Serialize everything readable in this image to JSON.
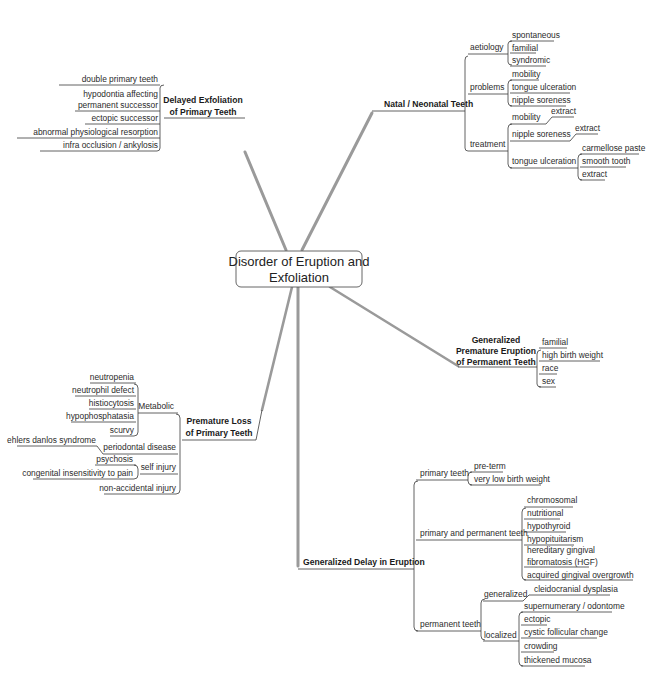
{
  "center": {
    "line1": "Disorder of Eruption and",
    "line2": "Exfoliation"
  },
  "delayed_exfoliation": {
    "title1": "Delayed Exfoliation",
    "title2": "of Primary Teeth",
    "items": [
      "double primary teeth",
      "hypodontia affecting",
      "permanent successor",
      "ectopic successor",
      "abnormal physiological resorption",
      "infra occlusion / ankylosis"
    ]
  },
  "natal": {
    "title": "Natal / Neonatal Teeth",
    "aetiology": {
      "label": "aetiology",
      "items": [
        "spontaneous",
        "familial",
        "syndromic"
      ]
    },
    "problems": {
      "label": "problems",
      "items": [
        "mobility",
        "tongue ulceration",
        "nipple soreness"
      ]
    },
    "treatment": {
      "label": "treatment",
      "mobility": {
        "label": "mobility",
        "items": [
          "extract"
        ]
      },
      "nipple": {
        "label": "nipple soreness",
        "items": [
          "extract"
        ]
      },
      "tongue": {
        "label": "tongue ulceration",
        "items": [
          "carmellose paste",
          "smooth tooth",
          "extract"
        ]
      }
    }
  },
  "premature_eruption": {
    "title1": "Generalized",
    "title2": "Premature Eruption",
    "title3": "of Permanent Teeth",
    "items": [
      "familial",
      "high birth weight",
      "race",
      "sex"
    ]
  },
  "premature_loss": {
    "title1": "Premature Loss",
    "title2": "of Primary Teeth",
    "metabolic": {
      "label": "Metabolic",
      "items": [
        "neutropenia",
        "neutrophil defect",
        "histiocytosis",
        "hypophosphatasia",
        "scurvy"
      ]
    },
    "periodontal": {
      "label": "periodontal disease",
      "items": [
        "ehlers danlos syndrome"
      ]
    },
    "self_injury": {
      "label": "self injury",
      "items": [
        "psychosis",
        "congenital insensitivity to pain"
      ]
    },
    "non_accidental": "non-accidental injury"
  },
  "delay_eruption": {
    "title": "Generalized Delay in Eruption",
    "primary": {
      "label": "primary teeth",
      "items": [
        "pre-term",
        "very low birth weight"
      ]
    },
    "primary_permanent": {
      "label": "primary and permanent teeth",
      "items": [
        "chromosomal",
        "nutritional",
        "hypothyroid",
        "hypopituitarism",
        "hereditary gingival",
        "fibromatosis (HGF)",
        "acquired gingival overgrowth"
      ]
    },
    "permanent": {
      "label": "permanent teeth",
      "generalized": {
        "label": "generalized",
        "items": [
          "cleidocranial dysplasia"
        ]
      },
      "localized": {
        "label": "localized",
        "items": [
          "supernumerary / odontome",
          "ectopic",
          "cystic follicular change",
          "crowding",
          "thickened mucosa"
        ]
      }
    }
  },
  "colors": {
    "connector": "#9a9a9a",
    "line": "#3a3a3a",
    "text": "#2b2b2b"
  }
}
